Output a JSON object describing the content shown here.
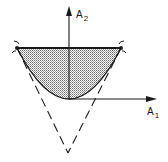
{
  "figure": {
    "axes": {
      "vertical_label": "A",
      "vertical_subscript": "2",
      "horizontal_label": "A",
      "horizontal_subscript": "1"
    },
    "elements": {
      "shaded_region": "region bounded by parabola and top horizontal chord",
      "dashed_cone": "two dashed lines meeting at a vertex below the origin",
      "corner_markers": [
        "left-corner-arc",
        "right-corner-arc"
      ]
    },
    "colors": {
      "ink": "#1a1a1a",
      "shade_dot": "#555555",
      "background": "#ffffff"
    }
  }
}
